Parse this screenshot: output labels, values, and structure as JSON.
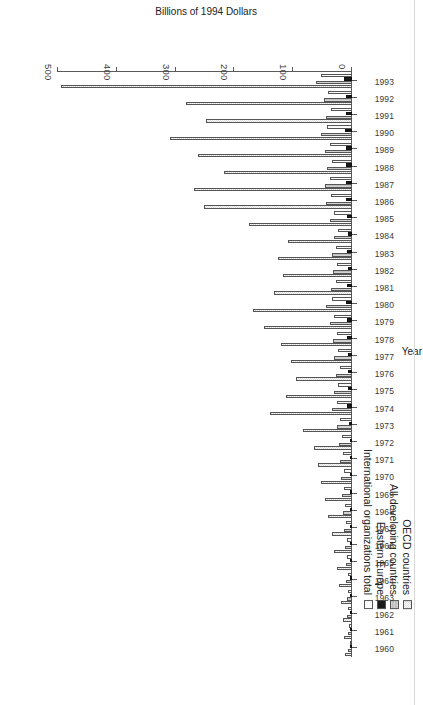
{
  "chart_data": {
    "type": "bar",
    "orientation": "horizontal",
    "title": "",
    "xlabel": "Billions of 1994 Dollars",
    "ylabel": "Year",
    "xlim": [
      0,
      500
    ],
    "xticks": [
      0,
      100,
      200,
      300,
      400,
      500
    ],
    "xtick_labels": [
      "0",
      "100",
      "200",
      "300",
      "400",
      "500"
    ],
    "grid": false,
    "legend_position": "left",
    "categories": [
      "1960",
      "1961",
      "1962",
      "1963",
      "1964",
      "1965",
      "1966",
      "1967",
      "1968",
      "1969",
      "1970",
      "1971",
      "1972",
      "1973",
      "1974",
      "1975",
      "1976",
      "1977",
      "1978",
      "1979",
      "1980",
      "1981",
      "1982",
      "1983",
      "1984",
      "1985",
      "1986",
      "1987",
      "1988",
      "1989",
      "1990",
      "1991",
      "1992",
      "1993"
    ],
    "series": [
      {
        "name": "OECD countries",
        "swatch": "dotted",
        "color": "#d9d9d9",
        "values": [
          12,
          14,
          16,
          18,
          22,
          26,
          30,
          34,
          40,
          46,
          52,
          58,
          64,
          84,
          140,
          112,
          96,
          104,
          120,
          150,
          168,
          132,
          118,
          126,
          108,
          176,
          252,
          268,
          218,
          262,
          310,
          248,
          282,
          495
        ]
      },
      {
        "name": "All developing countries",
        "swatch": "light-grey",
        "color": "#c9c9c9",
        "values": [
          6,
          7,
          8,
          9,
          10,
          11,
          12,
          14,
          16,
          17,
          18,
          20,
          22,
          26,
          34,
          30,
          28,
          30,
          33,
          38,
          44,
          36,
          33,
          34,
          31,
          38,
          44,
          46,
          42,
          46,
          52,
          44,
          48,
          62
        ]
      },
      {
        "name": "Eastern Europe",
        "swatch": "black",
        "color": "#1a1a1a",
        "values": [
          1,
          1,
          1,
          2,
          2,
          2,
          2,
          3,
          3,
          3,
          3,
          4,
          4,
          5,
          8,
          7,
          7,
          7,
          8,
          9,
          10,
          8,
          7,
          8,
          7,
          9,
          11,
          11,
          10,
          11,
          12,
          10,
          11,
          14
        ]
      },
      {
        "name": "International organizations total",
        "swatch": "white",
        "color": "#fbfbfb",
        "values": [
          4,
          5,
          6,
          6,
          7,
          8,
          9,
          10,
          12,
          13,
          14,
          15,
          17,
          20,
          26,
          23,
          21,
          23,
          26,
          30,
          34,
          28,
          26,
          27,
          24,
          30,
          36,
          38,
          34,
          38,
          43,
          36,
          40,
          52
        ]
      }
    ]
  },
  "legend": {
    "items": [
      {
        "label": "OECD countries"
      },
      {
        "label": "All developing countries"
      },
      {
        "label": "Eastern Europe"
      },
      {
        "label": "International organizations total"
      }
    ]
  },
  "axes": {
    "value_axis_title": "Billions of 1994 Dollars",
    "category_axis_title": "Year"
  }
}
